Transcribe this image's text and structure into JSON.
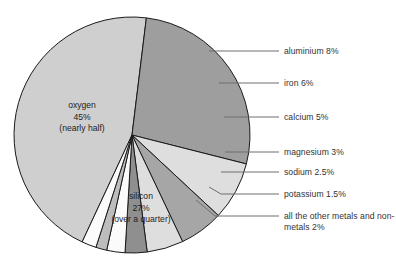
{
  "chart_data": {
    "type": "pie",
    "title": "",
    "subtitle": "",
    "xlabel": "",
    "ylabel": "",
    "legend_position": "callout-right",
    "grid": false,
    "units": "percent",
    "categories": [
      "oxygen",
      "silicon",
      "aluminium",
      "iron",
      "calcium",
      "magnesium",
      "sodium",
      "potassium",
      "all the other metals and non-metals"
    ],
    "values": [
      45,
      27,
      8,
      6,
      5,
      3,
      2.5,
      1.5,
      2
    ],
    "slices": [
      {
        "name": "oxygen",
        "value": 45,
        "value_text": "45%",
        "note": "(nearly half)",
        "label_placement": "inside",
        "color": "#cfcfcf",
        "start_angle": 205,
        "end_angle": 367
      },
      {
        "name": "silicon",
        "value": 27,
        "value_text": "27%",
        "note": "(over a quarter)",
        "label_placement": "inside",
        "color": "#9e9e9e",
        "start_angle": 108,
        "end_angle": 205
      },
      {
        "name": "aluminium",
        "value": 8,
        "value_text": "8%",
        "note": "",
        "label_placement": "callout",
        "color": "#dedede",
        "start_angle": 7,
        "end_angle": 35.8
      },
      {
        "name": "iron",
        "value": 6,
        "value_text": "6%",
        "note": "",
        "label_placement": "callout",
        "color": "#a6a6a6",
        "start_angle": 35.8,
        "end_angle": 57.4
      },
      {
        "name": "calcium",
        "value": 5,
        "value_text": "5%",
        "note": "",
        "label_placement": "callout",
        "color": "#dedede",
        "start_angle": 57.4,
        "end_angle": 75.4
      },
      {
        "name": "magnesium",
        "value": 3,
        "value_text": "3%",
        "note": "",
        "label_placement": "callout",
        "color": "#8f8f8f",
        "start_angle": 75.4,
        "end_angle": 86.2
      },
      {
        "name": "sodium",
        "value": 2.5,
        "value_text": "2.5%",
        "note": "",
        "label_placement": "callout",
        "color": "#fbfbfb",
        "start_angle": 86.2,
        "end_angle": 95.2
      },
      {
        "name": "potassium",
        "value": 1.5,
        "value_text": "1.5%",
        "note": "",
        "label_placement": "callout",
        "color": "#bdbdbd",
        "start_angle": 95.2,
        "end_angle": 100.6
      },
      {
        "name": "all the other metals and non-metals",
        "value": 2,
        "value_text": "2%",
        "note": "",
        "label_placement": "callout",
        "color": "#fbfbfb",
        "start_angle": 100.6,
        "end_angle": 108
      }
    ]
  },
  "callouts": [
    {
      "id": "aluminium",
      "text": "aluminium 8%"
    },
    {
      "id": "iron",
      "text": "iron 6%"
    },
    {
      "id": "calcium",
      "text": "calcium 5%"
    },
    {
      "id": "magnesium",
      "text": "magnesium 3%"
    },
    {
      "id": "sodium",
      "text": "sodium 2.5%"
    },
    {
      "id": "potassium",
      "text": "potassium 1.5%"
    },
    {
      "id": "other",
      "line1": "all the other metals",
      "line2": "and non-metals 2%"
    }
  ],
  "inner_labels": {
    "oxygen": {
      "name": "oxygen",
      "value": "45%",
      "note": "(nearly half)"
    },
    "silicon": {
      "name": "silicon",
      "value": "27%",
      "note": "(over a quarter)"
    }
  },
  "colors": {
    "background": "#ffffff",
    "outline": "#1a1a1a",
    "leader": "#6e6e6e",
    "text": "#333333"
  }
}
